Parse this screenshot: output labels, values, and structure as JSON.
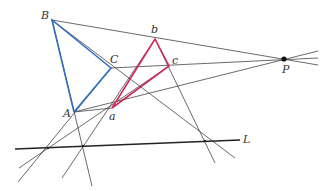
{
  "diagram": {
    "colors": {
      "triangle_ABC": "#2f6fc0",
      "triangle_abc": "#d02a5a",
      "lines": "#444444",
      "axis_L": "#222222",
      "point_P": "#111111"
    },
    "labels": {
      "B": "B",
      "C": "C",
      "A": "A",
      "b": "b",
      "c": "c",
      "a": "a",
      "P": "P",
      "L": "L"
    }
  }
}
